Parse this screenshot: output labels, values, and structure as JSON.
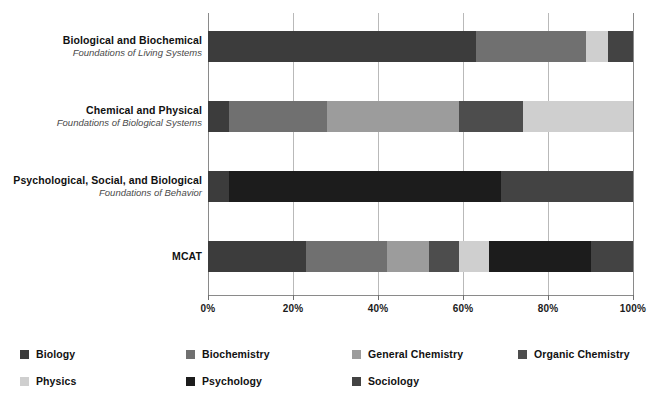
{
  "chart_data": {
    "type": "bar",
    "orientation": "horizontal",
    "stacked": true,
    "stack_mode": "percent",
    "title": "",
    "xlabel": "",
    "ylabel": "",
    "xlim": [
      0,
      100
    ],
    "grid": true,
    "legend_position": "bottom",
    "xticks": [
      {
        "value": 0,
        "label": "0%"
      },
      {
        "value": 20,
        "label": "20%"
      },
      {
        "value": 40,
        "label": "40%"
      },
      {
        "value": 60,
        "label": "60%"
      },
      {
        "value": 80,
        "label": "80%"
      },
      {
        "value": 100,
        "label": "100%"
      }
    ],
    "categories": [
      {
        "id": "bio-biochem",
        "line1": "Biological and Biochemical",
        "line2": "Foundations of Living Systems"
      },
      {
        "id": "chem-phys",
        "line1": "Chemical and Physical",
        "line2": "Foundations of Biological Systems"
      },
      {
        "id": "psych-soc-bio",
        "line1": "Psychological, Social, and Biological",
        "line2": "Foundations of Behavior"
      },
      {
        "id": "mcat",
        "line1": "MCAT",
        "line2": ""
      }
    ],
    "series": [
      {
        "name": "Biology",
        "color": "#3c3c3c",
        "values": [
          63,
          5,
          5,
          23
        ]
      },
      {
        "name": "Biochemistry",
        "color": "#707070",
        "values": [
          26,
          23,
          0,
          19
        ]
      },
      {
        "name": "General Chemistry",
        "color": "#9c9c9c",
        "values": [
          0,
          31,
          0,
          10
        ]
      },
      {
        "name": "Organic Chemistry",
        "color": "#4d4d4d",
        "values": [
          0,
          15,
          0,
          7
        ]
      },
      {
        "name": "Physics",
        "color": "#cfcfcf",
        "values": [
          5,
          26,
          0,
          7
        ]
      },
      {
        "name": "Psychology",
        "color": "#1c1c1c",
        "values": [
          0,
          0,
          64,
          24
        ]
      },
      {
        "name": "Sociology",
        "color": "#434343",
        "values": [
          6,
          0,
          31,
          10
        ]
      }
    ]
  },
  "legend": {
    "items": [
      {
        "label": "Biology",
        "color": "#3c3c3c"
      },
      {
        "label": "Biochemistry",
        "color": "#707070"
      },
      {
        "label": "General Chemistry",
        "color": "#9c9c9c"
      },
      {
        "label": "Organic Chemistry",
        "color": "#4d4d4d"
      },
      {
        "label": "Physics",
        "color": "#cfcfcf"
      },
      {
        "label": "Psychology",
        "color": "#1c1c1c"
      },
      {
        "label": "Sociology",
        "color": "#434343"
      }
    ]
  },
  "style": {
    "background": "#ffffff",
    "axis_color": "#8a8a8a",
    "grid_color": "#b9b9b9",
    "text_color": "#111111",
    "subtext_color": "#4a4a4a"
  }
}
